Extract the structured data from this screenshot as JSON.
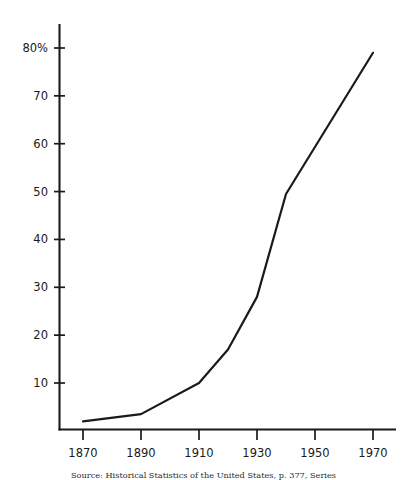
{
  "chart_data": {
    "type": "line",
    "title": "",
    "subtitle": "",
    "xlabel": "",
    "ylabel": "",
    "x": [
      1870,
      1890,
      1910,
      1920,
      1930,
      1940,
      1970
    ],
    "values": [
      2,
      3.5,
      10,
      17,
      28,
      49.5,
      79
    ],
    "series": [
      {
        "name": "Percentage",
        "x": [
          1870,
          1890,
          1910,
          1920,
          1930,
          1940,
          1970
        ],
        "values": [
          2,
          3.5,
          10,
          17,
          28,
          49.5,
          79
        ],
        "color": "#1a1a1a"
      }
    ],
    "xlim": [
      1862,
      1380
    ],
    "ylim": [
      0,
      84
    ],
    "x_tick_labels": [
      "1870",
      "1890",
      "1910",
      "1930",
      "1950",
      "1970"
    ],
    "x_tick_values": [
      1870,
      1890,
      1910,
      1930,
      1950,
      1970
    ],
    "y_tick_labels": [
      "10",
      "20",
      "30",
      "40",
      "50",
      "60",
      "70",
      "80%"
    ],
    "y_tick_values": [
      10,
      20,
      30,
      40,
      50,
      60,
      70,
      80
    ],
    "grid": false,
    "legend": "none",
    "annotations": []
  },
  "axes": {
    "y_ticks": [
      {
        "value": 80,
        "label": "80%"
      },
      {
        "value": 70,
        "label": "70"
      },
      {
        "value": 60,
        "label": "60"
      },
      {
        "value": 50,
        "label": "50"
      },
      {
        "value": 40,
        "label": "40"
      },
      {
        "value": 30,
        "label": "30"
      },
      {
        "value": 20,
        "label": "20"
      },
      {
        "value": 10,
        "label": "10"
      }
    ],
    "x_ticks": [
      {
        "value": 1870,
        "label": "1870"
      },
      {
        "value": 1890,
        "label": "1890"
      },
      {
        "value": 1910,
        "label": "1910"
      },
      {
        "value": 1930,
        "label": "1930"
      },
      {
        "value": 1950,
        "label": "1950"
      },
      {
        "value": 1970,
        "label": "1970"
      }
    ]
  },
  "caption": {
    "text": "Source: Historical Statistics of the United States, p. 377, Series"
  },
  "colors": {
    "line": "#1a1a1a",
    "axis": "#1a1a1a",
    "background": "#ffffff",
    "text": "#1a1a1a"
  }
}
